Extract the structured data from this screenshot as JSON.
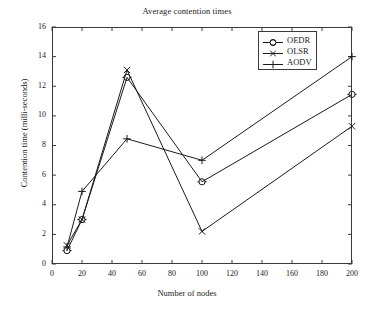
{
  "chart_data": {
    "type": "line",
    "title": "Average contention times",
    "xlabel": "Number of nodes",
    "ylabel": "Contention time (milli-seconds)",
    "xlim": [
      0,
      200
    ],
    "ylim": [
      0,
      16
    ],
    "xticks": [
      0,
      20,
      40,
      60,
      80,
      100,
      120,
      140,
      160,
      180,
      200
    ],
    "yticks": [
      0,
      2,
      4,
      6,
      8,
      10,
      12,
      14,
      16
    ],
    "grid": false,
    "legend_position": "top-right",
    "x": [
      10,
      20,
      50,
      100,
      200
    ],
    "series": [
      {
        "name": "OEDR",
        "marker": "circle",
        "color": "#1a1a1a",
        "x": [
          10,
          20,
          50,
          100,
          200
        ],
        "values": [
          0.9,
          3.0,
          12.6,
          5.55,
          11.45
        ]
      },
      {
        "name": "OLSR",
        "marker": "x",
        "color": "#1a1a1a",
        "x": [
          10,
          20,
          50,
          100,
          200
        ],
        "values": [
          1.25,
          3.0,
          13.1,
          2.2,
          9.3
        ]
      },
      {
        "name": "AODV",
        "marker": "plus",
        "color": "#1a1a1a",
        "x": [
          10,
          20,
          50,
          100,
          200
        ],
        "values": [
          1.15,
          4.9,
          8.45,
          7.0,
          14.0
        ]
      }
    ]
  },
  "legend": {
    "entries": [
      {
        "label": "OEDR",
        "marker": "circle-marker-icon"
      },
      {
        "label": "OLSR",
        "marker": "x-marker-icon"
      },
      {
        "label": "AODV",
        "marker": "plus-marker-icon"
      }
    ]
  },
  "axes": {
    "x_tick_labels": [
      "0",
      "20",
      "40",
      "60",
      "80",
      "100",
      "120",
      "140",
      "160",
      "180",
      "200"
    ],
    "y_tick_labels": [
      "0",
      "2",
      "4",
      "6",
      "8",
      "10",
      "12",
      "14",
      "16"
    ]
  },
  "colors": {
    "line": "#1a1a1a",
    "frame": "#3a3a3a",
    "background": "#ffffff",
    "text": "#222222"
  }
}
